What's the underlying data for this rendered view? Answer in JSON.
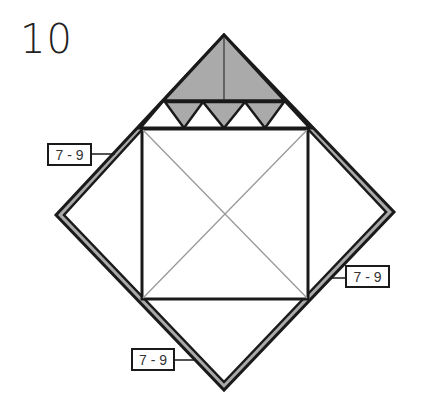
{
  "diagram": {
    "step_number": "10",
    "colors": {
      "outline": "#1a1a1a",
      "shade": "#aaaaaa",
      "crease": "#999999",
      "paper": "#ffffff"
    },
    "labels": [
      {
        "id": "left",
        "text": "7 - 9"
      },
      {
        "id": "right",
        "text": "7 - 9"
      },
      {
        "id": "bottom",
        "text": "7 - 9"
      }
    ]
  }
}
